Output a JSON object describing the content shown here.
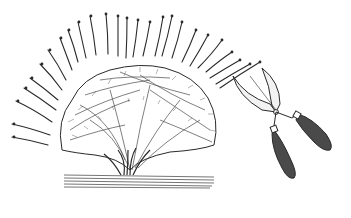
{
  "illustration": {
    "subject": "Lavender bush with cut sprigs fanned in an arc and hedge shears",
    "style": "black-and-white engraving",
    "colors": {
      "background": "#ffffff",
      "ink": "#2a2a2a",
      "handle": "#4a4a4a"
    },
    "elements": {
      "bush": "lavender-bush",
      "sprigs": "cut-lavender-sprigs",
      "shears": "hedge-shears",
      "ground": "ground-lines"
    }
  }
}
